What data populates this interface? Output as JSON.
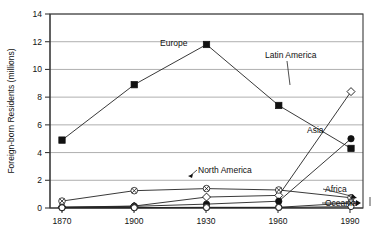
{
  "chart_data": {
    "type": "line",
    "title": "",
    "xlabel": "",
    "ylabel": "Foreign-born Residents (millions)",
    "x": [
      1870,
      1900,
      1930,
      1960,
      1990
    ],
    "xtick_labels": [
      "1870",
      "1900",
      "1930",
      "1960",
      "1990"
    ],
    "ytick_labels": [
      "0",
      "2",
      "4",
      "6",
      "8",
      "10",
      "12",
      "14"
    ],
    "ylim": [
      0,
      14
    ],
    "ytick_step": 2,
    "grid": "horizontal",
    "legend": "inline-annotations",
    "series": [
      {
        "name": "Europe",
        "marker": "filled-square",
        "label": "Europe",
        "values": [
          4.9,
          8.9,
          11.8,
          7.4,
          4.3
        ]
      },
      {
        "name": "Latin America",
        "marker": "open-diamond",
        "label": "Latin America",
        "values": [
          0.06,
          0.14,
          0.79,
          0.91,
          8.4
        ]
      },
      {
        "name": "Asia",
        "marker": "filled-circle",
        "label": "Asia",
        "values": [
          0.06,
          0.12,
          0.28,
          0.49,
          5.0
        ]
      },
      {
        "name": "North America",
        "marker": "crossed-circle",
        "label": "North America",
        "values": [
          0.5,
          1.25,
          1.4,
          1.3,
          0.74
        ]
      },
      {
        "name": "Africa",
        "marker": "crossed-circle",
        "label": "Africa",
        "values": [
          0.03,
          0.03,
          0.05,
          0.05,
          0.36
        ]
      },
      {
        "name": "Oceania",
        "marker": "open-circle",
        "label": "Oceania",
        "values": [
          0.02,
          0.02,
          0.03,
          0.04,
          0.1
        ]
      }
    ],
    "annotations": [
      {
        "text": "Europe",
        "at_x": 1930,
        "kind": "series-label"
      },
      {
        "text": "Latin America",
        "at_x": 1990,
        "kind": "series-label"
      },
      {
        "text": "Asia",
        "at_x": 1990,
        "kind": "series-label"
      },
      {
        "text": "North America",
        "at_x": 1930,
        "kind": "series-label"
      },
      {
        "text": "Africa",
        "at_x": 1990,
        "kind": "series-label"
      },
      {
        "text": "Oceania",
        "at_x": 1990,
        "kind": "series-label"
      }
    ]
  }
}
